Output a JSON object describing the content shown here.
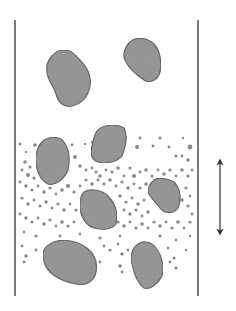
{
  "diagram": {
    "colors": {
      "background": "#ffffff",
      "wall": "#333333",
      "particle_fill": "#9c9c9c",
      "particle_stroke": "#6e6e6e",
      "dot_fill": "#8a8a8a",
      "arrow": "#333333"
    },
    "walls": {
      "left": {
        "x": 15,
        "y1": 20,
        "y2": 296
      },
      "right": {
        "x": 198,
        "y1": 20,
        "y2": 296
      }
    },
    "arrow": {
      "x": 220,
      "y1": 158,
      "y2": 236,
      "double_headed": true
    },
    "large_particles": [
      {
        "name": "particle-1",
        "path": "M52,56 C58,48 70,48 76,56 C84,64 92,72 90,86 C88,98 80,104 72,106 C64,108 58,102 56,94 C54,86 48,82 47,72 C46,64 48,60 52,56 Z"
      },
      {
        "name": "particle-2",
        "path": "M130,42 C136,36 148,38 154,44 C160,50 162,62 160,72 C158,80 150,84 144,80 C138,76 130,70 126,62 C122,56 124,48 130,42 Z"
      },
      {
        "name": "particle-3",
        "path": "M98,130 C104,124 118,124 124,128 C128,136 126,146 122,156 C118,162 106,164 98,162 C92,160 90,154 92,146 C94,138 94,134 98,130 Z"
      },
      {
        "name": "particle-4",
        "path": "M42,142 C48,136 60,136 64,142 C70,150 70,160 68,170 C64,180 54,186 48,184 C40,180 36,170 36,160 C36,152 38,146 42,142 Z"
      },
      {
        "name": "particle-5",
        "path": "M152,182 C156,176 166,178 174,182 C180,188 182,198 178,208 C174,214 164,214 160,208 C156,202 150,198 148,192 C148,188 150,184 152,182 Z"
      },
      {
        "name": "particle-6",
        "path": "M84,192 C90,188 102,190 108,196 C116,204 118,214 116,224 C112,230 102,230 94,228 C86,226 82,218 80,210 C80,202 80,196 84,192 Z"
      },
      {
        "name": "particle-7",
        "path": "M50,244 C58,238 74,240 84,246 C94,252 98,262 96,272 C94,282 86,286 76,284 C66,282 56,278 50,272 C44,266 42,256 44,250 C46,246 48,245 50,244 Z"
      },
      {
        "name": "particle-8",
        "path": "M138,244 C144,240 152,242 156,248 C162,256 164,266 162,276 C158,284 150,290 144,288 C138,284 134,274 132,264 C130,256 132,248 138,244 Z"
      }
    ],
    "small_particles": [
      [
        20,
        144,
        1.4
      ],
      [
        35,
        145,
        1.8
      ],
      [
        26,
        152,
        1.2
      ],
      [
        72,
        145,
        1.4
      ],
      [
        85,
        144,
        1.2
      ],
      [
        92,
        142,
        1.2
      ],
      [
        140,
        138,
        1.4
      ],
      [
        160,
        138,
        1.6
      ],
      [
        169,
        147,
        1.4
      ],
      [
        183,
        138,
        1.2
      ],
      [
        190,
        147,
        2.4
      ],
      [
        137,
        147,
        2
      ],
      [
        153,
        146,
        1.4
      ],
      [
        176,
        156,
        1.6
      ],
      [
        182,
        156,
        1.4
      ],
      [
        188,
        160,
        1.8
      ],
      [
        25,
        162,
        1.8
      ],
      [
        30,
        167,
        1.6
      ],
      [
        22,
        170,
        1.4
      ],
      [
        28,
        175,
        2
      ],
      [
        34,
        178,
        1.6
      ],
      [
        75,
        157,
        2
      ],
      [
        80,
        166,
        1.8
      ],
      [
        86,
        170,
        1.4
      ],
      [
        92,
        168,
        1.4
      ],
      [
        96,
        172,
        1.6
      ],
      [
        100,
        176,
        1.8
      ],
      [
        106,
        170,
        1.4
      ],
      [
        112,
        172,
        1.6
      ],
      [
        118,
        168,
        1.8
      ],
      [
        124,
        176,
        1.4
      ],
      [
        130,
        168,
        1.6
      ],
      [
        134,
        176,
        2
      ],
      [
        140,
        172,
        1.4
      ],
      [
        146,
        170,
        1.8
      ],
      [
        152,
        176,
        1.6
      ],
      [
        158,
        170,
        1.4
      ],
      [
        164,
        174,
        1.8
      ],
      [
        170,
        170,
        1.6
      ],
      [
        176,
        176,
        1.4
      ],
      [
        182,
        170,
        1.8
      ],
      [
        188,
        176,
        1.6
      ],
      [
        192,
        170,
        1.4
      ],
      [
        20,
        182,
        1.4
      ],
      [
        26,
        186,
        1.8
      ],
      [
        32,
        190,
        1.6
      ],
      [
        38,
        186,
        1.4
      ],
      [
        44,
        192,
        1.8
      ],
      [
        50,
        188,
        1.6
      ],
      [
        56,
        194,
        1.4
      ],
      [
        62,
        190,
        1.8
      ],
      [
        68,
        186,
        2
      ],
      [
        74,
        192,
        1.6
      ],
      [
        80,
        186,
        1.4
      ],
      [
        86,
        180,
        1.6
      ],
      [
        92,
        184,
        1.8
      ],
      [
        98,
        180,
        1.4
      ],
      [
        104,
        184,
        1.6
      ],
      [
        110,
        180,
        1.8
      ],
      [
        116,
        186,
        1.4
      ],
      [
        122,
        182,
        1.6
      ],
      [
        128,
        188,
        1.8
      ],
      [
        134,
        184,
        1.4
      ],
      [
        140,
        188,
        1.6
      ],
      [
        146,
        184,
        1.8
      ],
      [
        186,
        188,
        1.6
      ],
      [
        190,
        196,
        1.4
      ],
      [
        182,
        200,
        1.8
      ],
      [
        188,
        206,
        1.6
      ],
      [
        192,
        214,
        1.4
      ],
      [
        22,
        198,
        1.6
      ],
      [
        28,
        204,
        1.8
      ],
      [
        34,
        200,
        1.4
      ],
      [
        40,
        206,
        1.6
      ],
      [
        46,
        202,
        1.8
      ],
      [
        52,
        208,
        1.4
      ],
      [
        58,
        204,
        1.6
      ],
      [
        64,
        210,
        1.8
      ],
      [
        70,
        204,
        1.4
      ],
      [
        76,
        210,
        1.6
      ],
      [
        120,
        196,
        1.8
      ],
      [
        126,
        202,
        1.6
      ],
      [
        132,
        198,
        1.4
      ],
      [
        138,
        204,
        1.8
      ],
      [
        144,
        200,
        1.6
      ],
      [
        124,
        210,
        1.4
      ],
      [
        130,
        214,
        1.8
      ],
      [
        136,
        210,
        1.6
      ],
      [
        142,
        216,
        1.4
      ],
      [
        148,
        212,
        1.8
      ],
      [
        20,
        214,
        1.4
      ],
      [
        26,
        218,
        1.8
      ],
      [
        32,
        222,
        1.6
      ],
      [
        38,
        218,
        1.4
      ],
      [
        44,
        224,
        1.8
      ],
      [
        50,
        220,
        1.6
      ],
      [
        56,
        226,
        1.4
      ],
      [
        62,
        222,
        1.8
      ],
      [
        68,
        226,
        1.6
      ],
      [
        74,
        222,
        1.4
      ],
      [
        118,
        222,
        1.6
      ],
      [
        124,
        226,
        1.8
      ],
      [
        130,
        222,
        1.4
      ],
      [
        136,
        228,
        1.6
      ],
      [
        142,
        224,
        1.8
      ],
      [
        148,
        228,
        1.4
      ],
      [
        154,
        222,
        1.6
      ],
      [
        160,
        226,
        1.8
      ],
      [
        166,
        222,
        1.4
      ],
      [
        172,
        228,
        1.6
      ],
      [
        178,
        222,
        1.8
      ],
      [
        184,
        228,
        1.4
      ],
      [
        190,
        222,
        1.6
      ],
      [
        24,
        232,
        1.4
      ],
      [
        36,
        236,
        1.6
      ],
      [
        60,
        236,
        1.4
      ],
      [
        80,
        234,
        1.4
      ],
      [
        100,
        238,
        1.6
      ],
      [
        120,
        236,
        1.4
      ],
      [
        160,
        236,
        1.6
      ],
      [
        176,
        240,
        1.4
      ],
      [
        190,
        236,
        1.2
      ],
      [
        22,
        246,
        1.4
      ],
      [
        26,
        256,
        1.8
      ],
      [
        36,
        250,
        1.4
      ],
      [
        104,
        246,
        1.4
      ],
      [
        110,
        250,
        1.6
      ],
      [
        118,
        244,
        1.4
      ],
      [
        122,
        254,
        1.8
      ],
      [
        128,
        250,
        1.4
      ],
      [
        168,
        248,
        1.4
      ],
      [
        174,
        258,
        1.6
      ],
      [
        186,
        250,
        1.2
      ],
      [
        100,
        262,
        1.4
      ],
      [
        120,
        266,
        1.8
      ],
      [
        122,
        272,
        1.4
      ],
      [
        170,
        262,
        1.4
      ],
      [
        176,
        268,
        1.6
      ],
      [
        24,
        262,
        1.4
      ]
    ]
  }
}
